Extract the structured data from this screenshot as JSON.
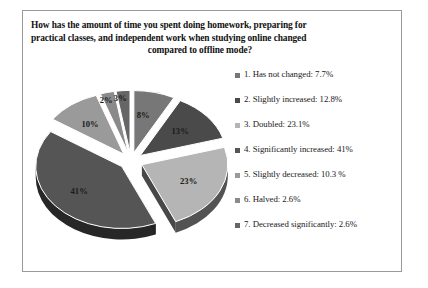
{
  "figure": {
    "title_line1": "How has the amount of time you spent doing homework, preparing for",
    "title_line2": "practical classes, and independent work when studying online changed",
    "title_line3": "compared to offline mode?"
  },
  "chart_data": {
    "type": "pie",
    "title": "How has the amount of time you spent doing homework, preparing for practical classes, and independent work when studying online changed compared to offline mode?",
    "exploded": true,
    "three_d": true,
    "legend_position": "right",
    "categories": [
      "1. Has not changed",
      "2. Slightly increased",
      "3. Doubled",
      "4. Significantly increased",
      "5. Slightly decreased",
      "6. Halved",
      "7. Decreased significantly"
    ],
    "values": [
      7.7,
      12.8,
      23.1,
      41,
      10.3,
      2.6,
      2.6
    ],
    "value_labels": [
      "7.7%",
      "12.8%",
      "23.1%",
      "41%",
      "10.3 %",
      "2.6%",
      "2.6%"
    ],
    "slice_labels": [
      "8%",
      "13%",
      "23%",
      "41%",
      "10%",
      "2%",
      "3%"
    ],
    "colors": [
      "#777777",
      "#4a4a4a",
      "#b5b5b5",
      "#555555",
      "#9a9a9a",
      "#8a8a8a",
      "#666666"
    ],
    "legend": [
      {
        "label": "1. Has not changed: 7.7%",
        "color": "#777777"
      },
      {
        "label": "2. Slightly increased: 12.8%",
        "color": "#4a4a4a"
      },
      {
        "label": "3. Doubled: 23.1%",
        "color": "#b5b5b5"
      },
      {
        "label": "4. Significantly increased: 41%",
        "color": "#555555"
      },
      {
        "label": "5. Slightly decreased: 10.3 %",
        "color": "#9a9a9a"
      },
      {
        "label": "6. Halved: 2.6%",
        "color": "#8a8a8a"
      },
      {
        "label": "7. Decreased significantly: 2.6%",
        "color": "#666666"
      }
    ]
  }
}
